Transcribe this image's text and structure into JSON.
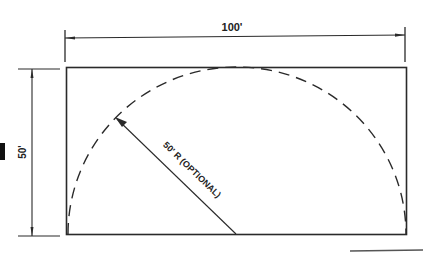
{
  "diagram": {
    "width_label": "100'",
    "height_label": "50'",
    "radius_label": "50' R (OPTIONAL)",
    "colors": {
      "line": "#2a2a2a",
      "background": "#ffffff"
    }
  }
}
